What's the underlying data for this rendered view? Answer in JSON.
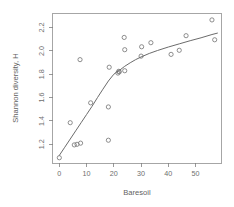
{
  "chart_data": {
    "type": "scatter",
    "title": "",
    "xlabel": "Baresoil",
    "ylabel": "Shannon diversity, H",
    "xlim": [
      -2.5,
      59.5
    ],
    "ylim": [
      1.04,
      2.32
    ],
    "xticks": [
      0,
      10,
      20,
      30,
      40,
      50
    ],
    "xticklabels": [
      "0",
      "10",
      "20",
      "30",
      "40",
      "50"
    ],
    "yticks": [
      1.2,
      1.4,
      1.6,
      1.8,
      2.0,
      2.2
    ],
    "yticklabels": [
      "1.2",
      "1.4",
      "1.6",
      "1.8",
      "2.0",
      "2.2"
    ],
    "grid": false,
    "legend": null,
    "point_marker": "open-circle",
    "point_color": "#7a7a7a",
    "line_color": "#6b6b6b",
    "x": [
      0,
      4,
      5.5,
      6.5,
      7.8,
      7.6,
      11.5,
      18,
      18,
      18.3,
      21.5,
      21.8,
      22,
      23.8,
      24,
      24,
      30,
      30.2,
      33.6,
      41,
      44,
      46.5,
      56,
      57
    ],
    "y": [
      1.085,
      1.385,
      1.195,
      1.2,
      1.21,
      1.925,
      1.555,
      1.235,
      1.52,
      1.86,
      1.81,
      1.825,
      1.82,
      2.115,
      2.01,
      1.83,
      1.955,
      2.035,
      2.07,
      1.97,
      2.005,
      2.13,
      2.265,
      2.095
    ],
    "points": [
      {
        "x": 0,
        "y": 1.085
      },
      {
        "x": 4,
        "y": 1.385
      },
      {
        "x": 5.5,
        "y": 1.195
      },
      {
        "x": 6.5,
        "y": 1.2
      },
      {
        "x": 7.8,
        "y": 1.21
      },
      {
        "x": 7.6,
        "y": 1.925
      },
      {
        "x": 11.5,
        "y": 1.555
      },
      {
        "x": 18,
        "y": 1.235
      },
      {
        "x": 18,
        "y": 1.52
      },
      {
        "x": 18.3,
        "y": 1.86
      },
      {
        "x": 21.5,
        "y": 1.81
      },
      {
        "x": 21.8,
        "y": 1.825
      },
      {
        "x": 22,
        "y": 1.82
      },
      {
        "x": 23.8,
        "y": 2.115
      },
      {
        "x": 24,
        "y": 2.01
      },
      {
        "x": 24,
        "y": 1.83
      },
      {
        "x": 30,
        "y": 1.955
      },
      {
        "x": 30.2,
        "y": 2.035
      },
      {
        "x": 33.6,
        "y": 2.07
      },
      {
        "x": 41,
        "y": 1.97
      },
      {
        "x": 44,
        "y": 2.005
      },
      {
        "x": 46.5,
        "y": 2.13
      },
      {
        "x": 56,
        "y": 2.265
      },
      {
        "x": 57,
        "y": 2.095
      }
    ],
    "fit_curve": {
      "name": "fitted trend line",
      "x": [
        0,
        2,
        4,
        6,
        8,
        10,
        12,
        14,
        16,
        18,
        20,
        21,
        22,
        24,
        26,
        28,
        30,
        33,
        36,
        40,
        44,
        48,
        52,
        56,
        58
      ],
      "y": [
        1.105,
        1.175,
        1.245,
        1.315,
        1.385,
        1.455,
        1.525,
        1.6,
        1.672,
        1.742,
        1.8,
        1.818,
        1.832,
        1.868,
        1.898,
        1.925,
        1.948,
        1.978,
        2.003,
        2.033,
        2.06,
        2.087,
        2.112,
        2.14,
        2.152
      ]
    }
  },
  "axis": {
    "xlabel": "Baresoil",
    "ylabel": "Shannon diversity, H"
  }
}
